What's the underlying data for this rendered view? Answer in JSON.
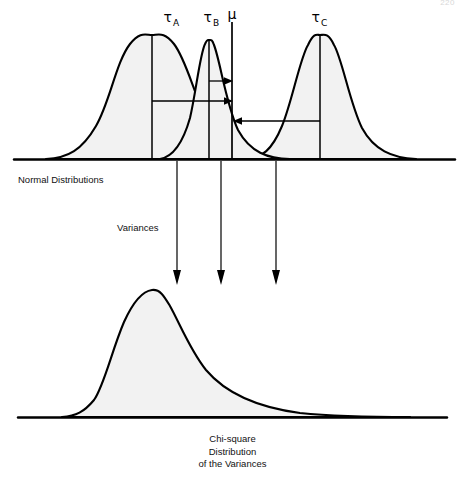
{
  "figure": {
    "page_number": "220",
    "top_panel": {
      "axis_label": "Normal Distributions",
      "mid_label": "Variances",
      "mean_symbol": "μ",
      "curves": [
        {
          "id": "tau-a",
          "symbol": "τ",
          "subscript": "A",
          "peak_x": 152,
          "peak_y": 35,
          "half_width": 92
        },
        {
          "id": "tau-b",
          "symbol": "τ",
          "subscript": "B",
          "peak_x": 209,
          "peak_y": 40,
          "half_width": 62
        },
        {
          "id": "tau-c",
          "symbol": "τ",
          "subscript": "C",
          "peak_x": 320,
          "peak_y": 35,
          "half_width": 72
        }
      ],
      "mean_line_x": 232,
      "baseline_y": 159,
      "deviation_arrows": [
        {
          "id": "arrow-tau-b-short",
          "from_x": 209,
          "to_x": 232,
          "y": 81,
          "direction": "right"
        },
        {
          "id": "arrow-tau-a-long",
          "from_x": 152,
          "to_x": 232,
          "y": 101,
          "direction": "right"
        },
        {
          "id": "arrow-tau-c-left",
          "from_x": 320,
          "to_x": 233,
          "y": 121,
          "direction": "left"
        }
      ]
    },
    "transfer_arrows": [
      {
        "id": "variance-arrow-a",
        "x": 177,
        "from_y": 162,
        "to_y": 284
      },
      {
        "id": "variance-arrow-b",
        "x": 221,
        "from_y": 162,
        "to_y": 284
      },
      {
        "id": "variance-arrow-c",
        "x": 276,
        "from_y": 162,
        "to_y": 284
      }
    ],
    "bottom_panel": {
      "baseline_y": 417,
      "peak_x": 152,
      "peak_y": 290,
      "caption_lines": [
        "Chi-square",
        "Distribution",
        "of the Variances"
      ]
    }
  }
}
